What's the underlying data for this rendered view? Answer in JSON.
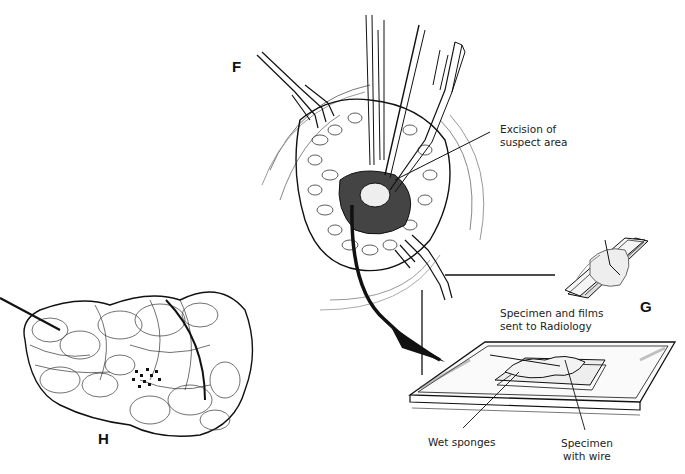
{
  "figure": {
    "panels": [
      {
        "id": "F",
        "letter": "F",
        "description": "Surgical field with retractors and forceps excising suspect breast tissue"
      },
      {
        "id": "G",
        "letter": "G",
        "description": "Specimen and films sent to Radiology"
      },
      {
        "id": "H",
        "letter": "H",
        "description": "Excised specimen with localization wire"
      }
    ],
    "labels": {
      "excision": "Excision of\nsuspect area",
      "excision_line1": "Excision of",
      "excision_line2": "suspect area",
      "specimen_films_line1": "Specimen and films",
      "specimen_films_line2": "sent to Radiology",
      "wet_sponges": "Wet sponges",
      "specimen_wire_line1": "Specimen",
      "specimen_wire_line2": "with wire"
    },
    "colors": {
      "ink": "#111111",
      "background": "#ffffff",
      "text": "#222222"
    }
  }
}
